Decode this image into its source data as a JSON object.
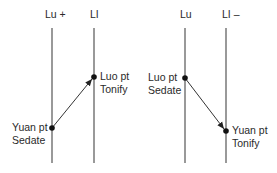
{
  "diagram": {
    "left_panel": {
      "channels": [
        {
          "label": "Lu +",
          "x": 52
        },
        {
          "label": "LI",
          "x": 94
        }
      ],
      "source_point": {
        "name": "Yuan pt",
        "action": "Sedate",
        "channel": "Lu",
        "y": 128
      },
      "target_point": {
        "name": "Luo pt",
        "action": "Tonify",
        "channel": "LI",
        "y": 77
      },
      "arrow_direction": "Lu to LI (upward)"
    },
    "right_panel": {
      "channels": [
        {
          "label": "Lu",
          "x": 185
        },
        {
          "label": "LI –",
          "x": 226
        }
      ],
      "source_point": {
        "name": "Luo pt",
        "action": "Sedate",
        "channel": "Lu",
        "y": 78
      },
      "target_point": {
        "name": "Yuan pt",
        "action": "Tonify",
        "channel": "LI",
        "y": 131
      },
      "arrow_direction": "Lu to LI (downward)"
    },
    "colors": {
      "line": "#555555",
      "dot": "#111111",
      "text": "#2a2a2a"
    }
  }
}
